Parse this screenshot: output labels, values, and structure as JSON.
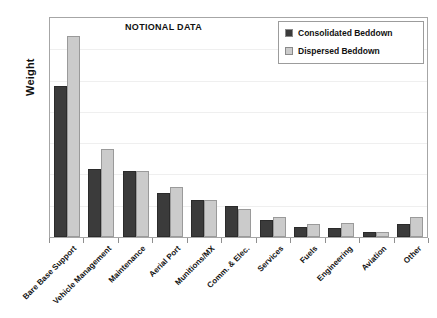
{
  "chart_data": {
    "type": "bar",
    "title": "NOTIONAL DATA",
    "xlabel": "",
    "ylabel": "Weight",
    "grid": true,
    "legend_position": "top-right",
    "ylim": [
      0,
      100
    ],
    "y_ticks_visible": false,
    "categories": [
      "Bare Base Support",
      "Vehicle Management",
      "Maintenance",
      "Aerial Port",
      "Munitions/MX",
      "Comm. & Elec.",
      "Services",
      "Fuels",
      "Engineering",
      "Aviation",
      "Other"
    ],
    "series": [
      {
        "name": "Consolidated Beddown",
        "color": "#3b3b3b",
        "values": [
          69,
          31,
          30,
          20,
          17,
          14,
          8,
          4.5,
          4,
          2.5,
          6
        ]
      },
      {
        "name": "Dispersed Beddown",
        "color": "#cbcbcb",
        "values": [
          92,
          40,
          30,
          23,
          17,
          13,
          9,
          6,
          6.5,
          2.5,
          9
        ]
      }
    ]
  },
  "chart": {
    "title": "NOTIONAL DATA",
    "y_axis_title": "Weight",
    "legend": [
      {
        "label": "Consolidated Beddown",
        "swatch": "#3b3b3b"
      },
      {
        "label": "Dispersed Beddown",
        "swatch": "#cbcbcb"
      }
    ],
    "frame_color": "#a6a6a6",
    "gridline_color": "#efefef",
    "background": "#ffffff"
  }
}
